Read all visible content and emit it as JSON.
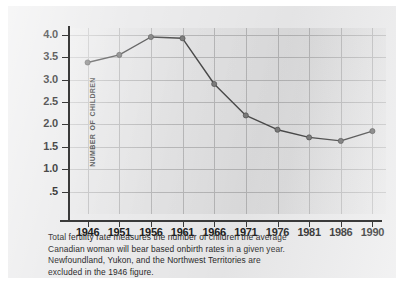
{
  "chart_data": {
    "type": "line",
    "title": "",
    "xlabel": "",
    "ylabel": "NUMBER OF CHILDREN",
    "categories": [
      "1946",
      "1951",
      "1956",
      "1961",
      "1966",
      "1971",
      "1976",
      "1981",
      "1986",
      "1990"
    ],
    "values": [
      3.38,
      3.55,
      3.95,
      3.92,
      2.9,
      2.2,
      1.88,
      1.71,
      1.63,
      1.85
    ],
    "series": [
      {
        "name": "Total fertility rate",
        "values": [
          3.38,
          3.55,
          3.95,
          3.92,
          2.9,
          2.2,
          1.88,
          1.71,
          1.63,
          1.85
        ]
      }
    ],
    "ytick_labels": [
      "4.0",
      "3.5",
      "3.0",
      "2.5",
      "2.0",
      "1.5",
      "1.0",
      ".5"
    ],
    "ytick_values": [
      4.0,
      3.5,
      3.0,
      2.5,
      2.0,
      1.5,
      1.0,
      0.5
    ],
    "ylim": [
      0,
      4.15
    ],
    "xlim": [
      "1946",
      "1990"
    ],
    "grid": true,
    "legend": "none",
    "line_color": "#4a4a4a",
    "marker_color": "#7b7b7b",
    "plot_background": "#e4e4e5"
  },
  "caption": {
    "line1": "Total fertility rate measures the number of children the average",
    "line2": "Canadian woman will bear based onbirth rates in a given year.",
    "line3": "Newfoundland, Yukon, and the Northwest Territories are",
    "line4": "excluded in the 1946 figure."
  }
}
